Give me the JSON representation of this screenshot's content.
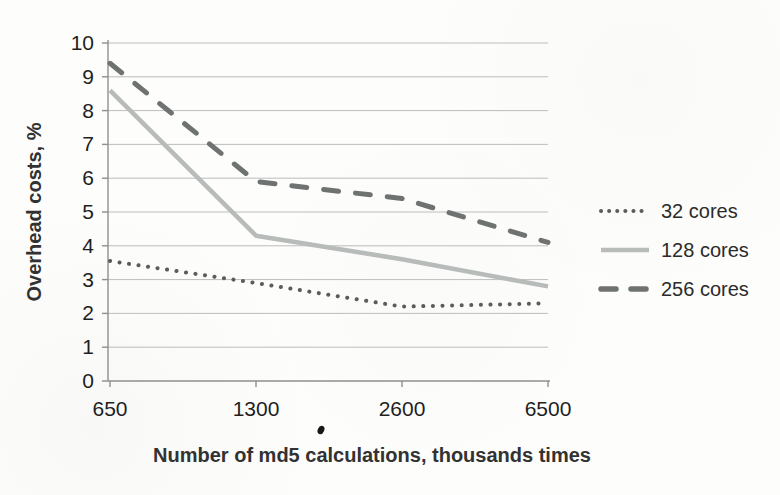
{
  "chart_data": {
    "type": "line",
    "title": "",
    "xlabel": "Number of md5 calculations, thousands times",
    "ylabel": "Overhead costs, %",
    "categories": [
      "650",
      "1300",
      "2600",
      "6500"
    ],
    "ylim": [
      0,
      10
    ],
    "ytick_labels": [
      "0",
      "1",
      "2",
      "3",
      "4",
      "5",
      "6",
      "7",
      "8",
      "9",
      "10"
    ],
    "grid": "horizontal",
    "legend_position": "right-center",
    "series": [
      {
        "name": "32 cores",
        "style": "dotted",
        "color": "#5c5c5c",
        "values": [
          3.55,
          2.9,
          2.2,
          2.3
        ]
      },
      {
        "name": "128 cores",
        "style": "solid",
        "color": "#b7bbb9",
        "values": [
          8.6,
          4.3,
          3.6,
          2.8
        ]
      },
      {
        "name": "256 cores",
        "style": "dashed",
        "color": "#6e7270",
        "values": [
          9.4,
          5.9,
          5.4,
          4.1
        ]
      }
    ],
    "colors": {
      "axis": "#8f8f8f",
      "grid": "#b6b6b6",
      "tick_text": "#1f1f1f",
      "title_text": "#323232"
    }
  },
  "artifacts": {
    "ink_speck_below_axis": true
  }
}
